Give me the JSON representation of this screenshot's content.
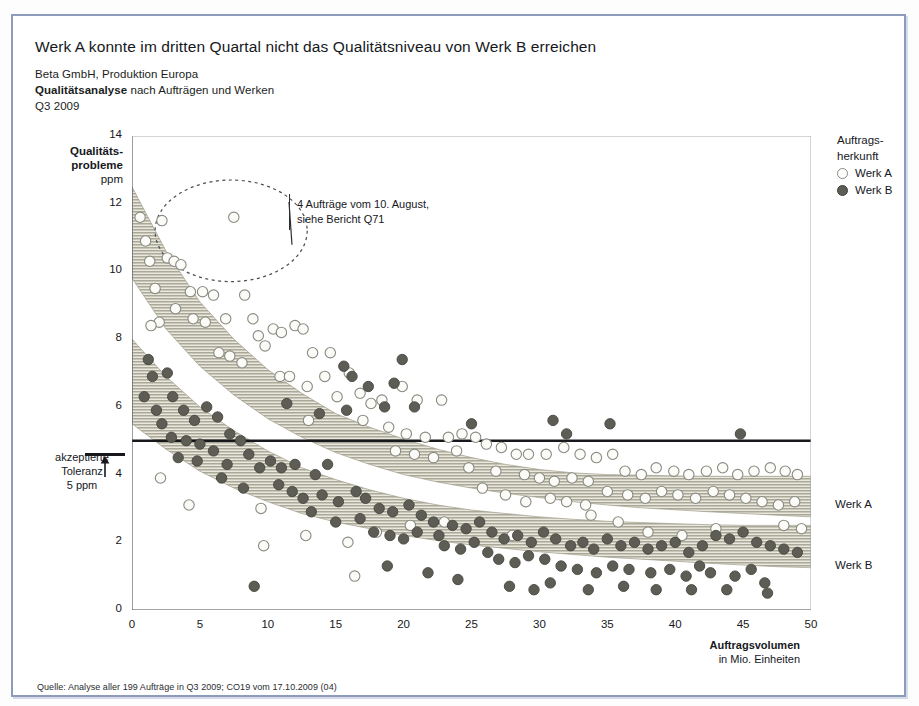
{
  "headline": "Werk A konnte im dritten Quartal nicht das Qualitätsniveau von Werk B erreichen",
  "subhead": {
    "line1": "Beta GmbH, Produktion Europa",
    "line2_bold": "Qualitätsanalyse",
    "line2_rest": " nach Aufträgen und Werken",
    "line3": "Q3 2009"
  },
  "legend": {
    "title": "Auftrags-\nherkunft",
    "items": [
      {
        "label": "Werk A",
        "marker": "open-circle",
        "color": "#ffffff"
      },
      {
        "label": "Werk B",
        "marker": "filled-circle",
        "color": "#5d5d55"
      }
    ]
  },
  "annotation": {
    "line1": "4 Aufträge vom 10. August,",
    "line2": "siehe Bericht Q71"
  },
  "tolerance": {
    "line1": "akzeptierte",
    "line2": "Toleranz",
    "line3": "5 ppm",
    "value": 5
  },
  "band_labels": {
    "a": "Werk A",
    "b": "Werk B"
  },
  "source": "Quelle: Analyse aller 199 Aufträge in Q3 2009; CO19 vom 17.10.2009 (04)",
  "colors": {
    "frame": "#8d9cbb",
    "band": "#a8a693",
    "werk_a_marker": "#ffffff",
    "werk_b_marker": "#5d5d55",
    "axis": "#16181c"
  },
  "chart_data": {
    "type": "scatter",
    "title": "Werk A konnte im dritten Quartal nicht das Qualitätsniveau von Werk B erreichen",
    "xlabel": "Auftragsvolumen",
    "xlabel_sub": "in Mio. Einheiten",
    "ylabel": "Qualitäts-probleme",
    "ylabel_sub": "ppm",
    "xlim": [
      0,
      50
    ],
    "ylim": [
      0,
      14
    ],
    "xticks": [
      0,
      5,
      10,
      15,
      20,
      25,
      30,
      35,
      40,
      45,
      50
    ],
    "yticks": [
      0,
      2,
      4,
      6,
      8,
      10,
      12,
      14
    ],
    "grid": false,
    "legend_position": "top-right",
    "reference_line": {
      "y": 5,
      "label": "akzeptierte Toleranz 5 ppm"
    },
    "bands": [
      {
        "name": "Werk A",
        "upper": [
          12.5,
          10.6,
          9.1,
          8.0,
          7.1,
          6.4,
          5.8,
          5.4,
          5.05,
          4.75,
          4.5,
          4.3,
          4.15,
          4.05,
          4.0,
          3.98,
          3.96,
          3.95,
          3.95,
          3.95,
          3.95
        ],
        "lower": [
          9.8,
          8.3,
          7.2,
          6.35,
          5.65,
          5.1,
          4.65,
          4.3,
          4.0,
          3.78,
          3.6,
          3.45,
          3.32,
          3.2,
          3.1,
          3.02,
          2.96,
          2.9,
          2.85,
          2.8,
          2.75
        ]
      },
      {
        "name": "Werk B",
        "upper": [
          8.0,
          6.9,
          6.0,
          5.3,
          4.7,
          4.2,
          3.85,
          3.55,
          3.3,
          3.1,
          2.95,
          2.85,
          2.75,
          2.68,
          2.62,
          2.58,
          2.55,
          2.52,
          2.5,
          2.5,
          2.5
        ],
        "lower": [
          5.5,
          4.75,
          4.1,
          3.6,
          3.2,
          2.85,
          2.6,
          2.4,
          2.2,
          2.05,
          1.92,
          1.82,
          1.72,
          1.64,
          1.56,
          1.5,
          1.44,
          1.38,
          1.33,
          1.28,
          1.25
        ]
      }
    ],
    "band_x": [
      0,
      2.5,
      5,
      7.5,
      10,
      12.5,
      15,
      17.5,
      20,
      22.5,
      25,
      27.5,
      30,
      32.5,
      35,
      37.5,
      40,
      42.5,
      45,
      47.5,
      50
    ],
    "ellipse_highlight": {
      "cx": 7.3,
      "cy": 11.2,
      "rx": 5.6,
      "ry": 1.5,
      "style": "dashed"
    },
    "series": [
      {
        "name": "Werk A",
        "marker": "open-circle",
        "points": [
          [
            0.6,
            11.6
          ],
          [
            1.0,
            10.9
          ],
          [
            1.3,
            10.3
          ],
          [
            2.2,
            11.5
          ],
          [
            2.6,
            10.4
          ],
          [
            3.1,
            10.3
          ],
          [
            3.6,
            10.2
          ],
          [
            1.7,
            9.5
          ],
          [
            2.0,
            8.5
          ],
          [
            1.4,
            8.4
          ],
          [
            4.3,
            9.4
          ],
          [
            5.2,
            9.4
          ],
          [
            3.2,
            8.9
          ],
          [
            6.0,
            9.3
          ],
          [
            7.5,
            11.6
          ],
          [
            8.3,
            9.3
          ],
          [
            4.5,
            8.6
          ],
          [
            5.4,
            8.5
          ],
          [
            6.9,
            8.6
          ],
          [
            8.9,
            8.6
          ],
          [
            10.4,
            8.3
          ],
          [
            9.3,
            8.1
          ],
          [
            11.0,
            8.2
          ],
          [
            12.0,
            8.4
          ],
          [
            12.6,
            8.3
          ],
          [
            6.4,
            7.6
          ],
          [
            7.2,
            7.5
          ],
          [
            8.1,
            7.3
          ],
          [
            9.8,
            7.8
          ],
          [
            13.3,
            7.6
          ],
          [
            14.6,
            7.6
          ],
          [
            10.9,
            6.9
          ],
          [
            11.6,
            6.9
          ],
          [
            12.9,
            6.6
          ],
          [
            14.2,
            6.9
          ],
          [
            16.0,
            7.0
          ],
          [
            15.1,
            6.3
          ],
          [
            13.0,
            5.6
          ],
          [
            16.8,
            6.4
          ],
          [
            17.6,
            6.1
          ],
          [
            18.4,
            6.2
          ],
          [
            19.9,
            6.6
          ],
          [
            21.0,
            6.2
          ],
          [
            22.8,
            6.2
          ],
          [
            17.0,
            5.6
          ],
          [
            18.9,
            5.4
          ],
          [
            20.2,
            5.2
          ],
          [
            21.6,
            5.1
          ],
          [
            23.3,
            5.1
          ],
          [
            24.3,
            5.2
          ],
          [
            25.3,
            5.1
          ],
          [
            19.4,
            4.7
          ],
          [
            20.8,
            4.6
          ],
          [
            22.2,
            4.5
          ],
          [
            23.9,
            4.7
          ],
          [
            26.1,
            4.9
          ],
          [
            27.2,
            4.8
          ],
          [
            28.3,
            4.6
          ],
          [
            24.8,
            4.2
          ],
          [
            26.8,
            4.1
          ],
          [
            29.2,
            4.6
          ],
          [
            30.5,
            4.6
          ],
          [
            31.8,
            4.8
          ],
          [
            33.0,
            4.6
          ],
          [
            34.2,
            4.5
          ],
          [
            35.4,
            4.6
          ],
          [
            28.9,
            4.0
          ],
          [
            30.0,
            3.9
          ],
          [
            31.1,
            3.8
          ],
          [
            32.4,
            3.9
          ],
          [
            33.6,
            3.8
          ],
          [
            36.3,
            4.1
          ],
          [
            37.5,
            4.0
          ],
          [
            38.6,
            4.2
          ],
          [
            39.9,
            4.1
          ],
          [
            41.0,
            4.0
          ],
          [
            42.3,
            4.1
          ],
          [
            43.5,
            4.2
          ],
          [
            44.6,
            4.0
          ],
          [
            45.8,
            4.1
          ],
          [
            47.0,
            4.2
          ],
          [
            48.1,
            4.1
          ],
          [
            49.0,
            4.0
          ],
          [
            35.0,
            3.5
          ],
          [
            36.5,
            3.4
          ],
          [
            37.8,
            3.3
          ],
          [
            39.0,
            3.5
          ],
          [
            40.2,
            3.4
          ],
          [
            41.5,
            3.3
          ],
          [
            42.8,
            3.5
          ],
          [
            44.0,
            3.4
          ],
          [
            45.2,
            3.3
          ],
          [
            46.4,
            3.2
          ],
          [
            47.6,
            3.1
          ],
          [
            48.8,
            3.2
          ],
          [
            30.8,
            3.3
          ],
          [
            32.0,
            3.2
          ],
          [
            33.4,
            3.1
          ],
          [
            25.8,
            3.6
          ],
          [
            27.5,
            3.4
          ],
          [
            29.0,
            3.2
          ],
          [
            2.1,
            3.9
          ],
          [
            4.2,
            3.1
          ],
          [
            9.5,
            3.0
          ],
          [
            15.9,
            2.0
          ],
          [
            16.4,
            1.0
          ],
          [
            9.7,
            1.9
          ],
          [
            20.5,
            2.5
          ],
          [
            23.0,
            2.6
          ],
          [
            33.8,
            2.8
          ],
          [
            35.8,
            2.6
          ],
          [
            43.0,
            2.4
          ],
          [
            48.0,
            2.5
          ],
          [
            49.3,
            2.4
          ],
          [
            12.8,
            2.2
          ],
          [
            18.0,
            2.3
          ],
          [
            28.0,
            2.2
          ],
          [
            38.0,
            2.3
          ],
          [
            40.5,
            2.2
          ]
        ]
      },
      {
        "name": "Werk B",
        "marker": "filled-circle",
        "points": [
          [
            1.2,
            7.4
          ],
          [
            1.5,
            6.9
          ],
          [
            0.9,
            6.3
          ],
          [
            2.6,
            7.0
          ],
          [
            1.8,
            5.9
          ],
          [
            2.2,
            5.5
          ],
          [
            3.0,
            6.3
          ],
          [
            3.8,
            5.9
          ],
          [
            4.6,
            5.6
          ],
          [
            5.5,
            6.0
          ],
          [
            6.3,
            5.7
          ],
          [
            2.9,
            5.1
          ],
          [
            4.0,
            5.0
          ],
          [
            5.0,
            4.9
          ],
          [
            3.4,
            4.5
          ],
          [
            4.8,
            4.4
          ],
          [
            6.0,
            4.7
          ],
          [
            7.2,
            5.2
          ],
          [
            8.0,
            5.0
          ],
          [
            7.0,
            4.3
          ],
          [
            8.6,
            4.6
          ],
          [
            9.4,
            4.2
          ],
          [
            6.6,
            3.9
          ],
          [
            8.2,
            3.6
          ],
          [
            9.0,
            0.7
          ],
          [
            10.2,
            4.4
          ],
          [
            11.0,
            4.2
          ],
          [
            12.0,
            4.3
          ],
          [
            10.8,
            3.7
          ],
          [
            11.8,
            3.5
          ],
          [
            12.6,
            3.3
          ],
          [
            13.5,
            4.0
          ],
          [
            14.4,
            4.3
          ],
          [
            15.6,
            7.2
          ],
          [
            16.2,
            6.9
          ],
          [
            17.4,
            6.6
          ],
          [
            19.3,
            6.7
          ],
          [
            19.9,
            7.4
          ],
          [
            14.0,
            3.4
          ],
          [
            15.2,
            3.2
          ],
          [
            16.5,
            3.5
          ],
          [
            17.2,
            3.3
          ],
          [
            13.2,
            2.9
          ],
          [
            15.0,
            2.6
          ],
          [
            16.8,
            2.7
          ],
          [
            18.2,
            3.0
          ],
          [
            19.2,
            2.9
          ],
          [
            20.4,
            3.1
          ],
          [
            21.3,
            2.8
          ],
          [
            22.2,
            2.6
          ],
          [
            17.8,
            2.3
          ],
          [
            19.0,
            2.2
          ],
          [
            20.0,
            2.1
          ],
          [
            21.0,
            2.3
          ],
          [
            22.6,
            2.2
          ],
          [
            23.6,
            2.5
          ],
          [
            24.6,
            2.4
          ],
          [
            25.6,
            2.6
          ],
          [
            26.5,
            2.3
          ],
          [
            23.0,
            1.9
          ],
          [
            24.2,
            1.8
          ],
          [
            25.2,
            2.0
          ],
          [
            26.2,
            1.7
          ],
          [
            27.4,
            2.1
          ],
          [
            28.4,
            2.2
          ],
          [
            29.4,
            2.0
          ],
          [
            30.3,
            2.3
          ],
          [
            31.2,
            2.1
          ],
          [
            27.0,
            1.5
          ],
          [
            28.2,
            1.4
          ],
          [
            29.2,
            1.6
          ],
          [
            30.4,
            1.5
          ],
          [
            31.6,
            1.3
          ],
          [
            32.3,
            1.9
          ],
          [
            33.2,
            2.0
          ],
          [
            34.0,
            1.8
          ],
          [
            35.0,
            2.1
          ],
          [
            36.0,
            1.9
          ],
          [
            37.0,
            2.0
          ],
          [
            38.0,
            1.8
          ],
          [
            32.8,
            1.2
          ],
          [
            34.2,
            1.1
          ],
          [
            35.4,
            1.3
          ],
          [
            36.6,
            1.2
          ],
          [
            38.2,
            1.1
          ],
          [
            39.0,
            1.9
          ],
          [
            40.0,
            2.0
          ],
          [
            41.0,
            1.7
          ],
          [
            42.0,
            1.9
          ],
          [
            43.0,
            2.2
          ],
          [
            44.0,
            2.1
          ],
          [
            45.0,
            2.3
          ],
          [
            46.0,
            2.0
          ],
          [
            47.0,
            1.9
          ],
          [
            48.0,
            1.8
          ],
          [
            49.0,
            1.7
          ],
          [
            39.6,
            1.2
          ],
          [
            40.8,
            1.0
          ],
          [
            41.8,
            1.3
          ],
          [
            42.6,
            1.1
          ],
          [
            44.4,
            1.0
          ],
          [
            45.6,
            1.2
          ],
          [
            46.6,
            0.8
          ],
          [
            46.8,
            0.5
          ],
          [
            43.8,
            0.6
          ],
          [
            41.2,
            0.6
          ],
          [
            38.6,
            0.6
          ],
          [
            36.2,
            0.7
          ],
          [
            33.6,
            0.6
          ],
          [
            30.8,
            0.8
          ],
          [
            29.6,
            0.6
          ],
          [
            27.8,
            0.7
          ],
          [
            24.0,
            0.9
          ],
          [
            21.8,
            1.1
          ],
          [
            18.8,
            1.3
          ],
          [
            32.0,
            5.2
          ],
          [
            44.8,
            5.2
          ],
          [
            25.0,
            5.5
          ],
          [
            31.0,
            5.6
          ],
          [
            35.2,
            5.5
          ],
          [
            13.8,
            5.8
          ],
          [
            18.6,
            6.0
          ],
          [
            20.8,
            6.0
          ],
          [
            11.4,
            6.1
          ],
          [
            15.8,
            5.9
          ]
        ]
      }
    ]
  }
}
